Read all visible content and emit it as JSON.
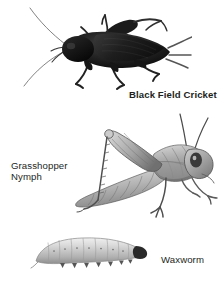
{
  "plate": {
    "background_color": "#ffffff",
    "width": 221,
    "height": 281,
    "text_color": "#221f1d"
  },
  "figures": [
    {
      "id": "black-field-cricket",
      "label": "Black Field Cricket",
      "label_bold": true,
      "rendering": "photographic silhouette",
      "tone": "#141414"
    },
    {
      "id": "grasshopper-nymph",
      "label": "Grasshopper\nNymph",
      "label_bold": false,
      "rendering": "line engraving",
      "tone": "#6e6e6e"
    },
    {
      "id": "waxworm",
      "label": "Waxworm",
      "label_bold": false,
      "rendering": "line engraving",
      "tone": "#b4b4b4"
    }
  ],
  "labels": {
    "cricket": "Black Field Cricket",
    "grasshopper": "Grasshopper\nNymph",
    "waxworm": "Waxworm"
  }
}
